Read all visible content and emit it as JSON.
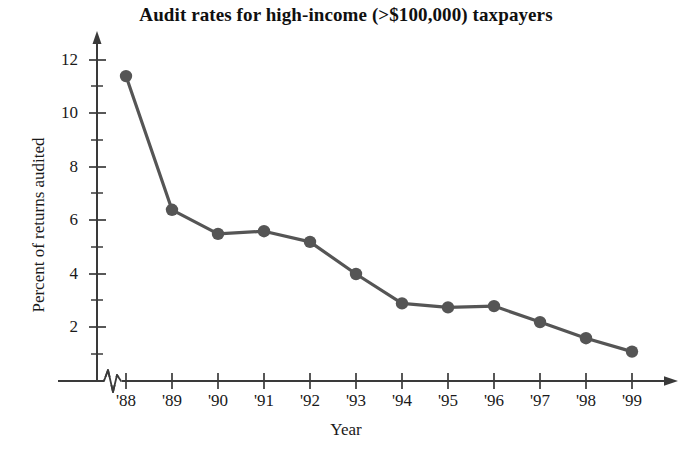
{
  "chart_data": {
    "type": "line",
    "title": "Audit rates for high-income (>$100,000) taxpayers",
    "xlabel": "Year",
    "ylabel": "Percent of returns audited",
    "categories": [
      "'88",
      "'89",
      "'90",
      "'91",
      "'92",
      "'93",
      "'94",
      "'95",
      "'96",
      "'97",
      "'98",
      "'99"
    ],
    "values": [
      11.4,
      6.4,
      5.5,
      5.6,
      5.2,
      4.0,
      2.9,
      2.75,
      2.8,
      2.2,
      1.6,
      1.1
    ],
    "series": [
      {
        "name": "Percent of returns audited",
        "values": [
          11.4,
          6.4,
          5.5,
          5.6,
          5.2,
          4.0,
          2.9,
          2.75,
          2.8,
          2.2,
          1.6,
          1.1
        ]
      }
    ],
    "ylim": [
      0,
      12.6
    ],
    "y_major_ticks": [
      2,
      4,
      6,
      8,
      10,
      12
    ],
    "y_minor_ticks": [
      1,
      3,
      5,
      7,
      9,
      11
    ],
    "y_tick_labels": [
      "2",
      "4",
      "6",
      "8",
      "10",
      "12"
    ],
    "grid": false,
    "legend": "none",
    "axis_break": "x-axis zigzag between origin and '88",
    "line_color": "#555555",
    "marker_color": "#555555",
    "marker_shape": "circle",
    "axis_color": "#3a3a3a"
  },
  "axes": {
    "y_ticks": [
      {
        "label": "12",
        "value": 12
      },
      {
        "label": "10",
        "value": 10
      },
      {
        "label": "8",
        "value": 8
      },
      {
        "label": "6",
        "value": 6
      },
      {
        "label": "4",
        "value": 4
      },
      {
        "label": "2",
        "value": 2
      }
    ],
    "x_ticks": [
      {
        "label": "'88"
      },
      {
        "label": "'89"
      },
      {
        "label": "'90"
      },
      {
        "label": "'91"
      },
      {
        "label": "'92"
      },
      {
        "label": "'93"
      },
      {
        "label": "'94"
      },
      {
        "label": "'95"
      },
      {
        "label": "'96"
      },
      {
        "label": "'97"
      },
      {
        "label": "'98"
      },
      {
        "label": "'99"
      }
    ]
  }
}
